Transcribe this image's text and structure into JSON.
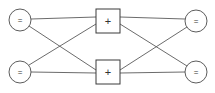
{
  "diagram": {
    "background_color": "#ffffff",
    "edge_color": "#5a5a5a",
    "node_stroke_color": "#4a4a4a",
    "node_fill_color": "#ffffff",
    "glyph_color": "#333333",
    "width": 215,
    "height": 93,
    "layers": [
      {
        "name": "input-layer",
        "shape": "circle",
        "nodes": [
          {
            "id": "in1",
            "label": "=",
            "icon": "equals-icon",
            "cx": 20,
            "cy": 20,
            "r": 11
          },
          {
            "id": "in2",
            "label": "=",
            "icon": "equals-icon",
            "cx": 20,
            "cy": 72,
            "r": 11
          }
        ]
      },
      {
        "name": "hidden-layer",
        "shape": "square",
        "nodes": [
          {
            "id": "mid1",
            "label": "+",
            "icon": "plus-icon",
            "x": 96,
            "y": 9,
            "size": 24
          },
          {
            "id": "mid2",
            "label": "+",
            "icon": "plus-icon",
            "x": 96,
            "y": 60,
            "size": 24
          }
        ]
      },
      {
        "name": "output-layer",
        "shape": "circle",
        "nodes": [
          {
            "id": "out1",
            "label": "=",
            "icon": "equals-icon",
            "cx": 196,
            "cy": 21,
            "r": 11
          },
          {
            "id": "out2",
            "label": "=",
            "icon": "equals-icon",
            "cx": 196,
            "cy": 72,
            "r": 11
          }
        ]
      }
    ],
    "edges": [
      {
        "id": "e1",
        "from": "in1",
        "to": "mid1",
        "x1": 31,
        "y1": 19,
        "x2": 96,
        "y2": 17
      },
      {
        "id": "e2",
        "from": "in1",
        "to": "mid2",
        "x1": 29,
        "y1": 26,
        "x2": 96,
        "y2": 70
      },
      {
        "id": "e3",
        "from": "in2",
        "to": "mid1",
        "x1": 29,
        "y1": 65,
        "x2": 96,
        "y2": 24
      },
      {
        "id": "e4",
        "from": "in2",
        "to": "mid2",
        "x1": 31,
        "y1": 72,
        "x2": 96,
        "y2": 73
      },
      {
        "id": "e5",
        "from": "mid1",
        "to": "out1",
        "x1": 120,
        "y1": 17,
        "x2": 185,
        "y2": 19
      },
      {
        "id": "e6",
        "from": "mid1",
        "to": "out2",
        "x1": 120,
        "y1": 24,
        "x2": 187,
        "y2": 66
      },
      {
        "id": "e7",
        "from": "mid2",
        "to": "out1",
        "x1": 120,
        "y1": 70,
        "x2": 187,
        "y2": 27
      },
      {
        "id": "e8",
        "from": "mid2",
        "to": "out2",
        "x1": 120,
        "y1": 73,
        "x2": 185,
        "y2": 72
      }
    ]
  }
}
